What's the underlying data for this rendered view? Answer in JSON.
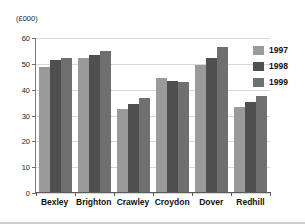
{
  "chart_data": {
    "type": "bar",
    "title": "",
    "xlabel": "",
    "ylabel": "(£000)",
    "ylim": [
      0,
      60
    ],
    "yticks": [
      0,
      10,
      20,
      30,
      40,
      50,
      60
    ],
    "grid": true,
    "legend_position": "right",
    "categories": [
      "Bexley",
      "Brighton",
      "Crawley",
      "Croydon",
      "Dover",
      "Redhill"
    ],
    "series": [
      {
        "name": "1997",
        "color": "#9a9a9a",
        "values": [
          48.5,
          52,
          32,
          44,
          49,
          33
        ]
      },
      {
        "name": "1998",
        "color": "#4f4f4f",
        "values": [
          51,
          53,
          34,
          43,
          52,
          35
        ]
      },
      {
        "name": "1999",
        "color": "#6f6f6f",
        "values": [
          52,
          54.5,
          36.5,
          42.5,
          56,
          37
        ]
      }
    ]
  },
  "axis": {
    "unit_label": "(£000)",
    "ytick_labels": [
      "60",
      "50",
      "40",
      "30",
      "20",
      "10",
      "0"
    ]
  },
  "header": {
    "cropped_title": ""
  },
  "legend": {
    "items": [
      {
        "label": "1997"
      },
      {
        "label": "1998"
      },
      {
        "label": "1999"
      }
    ]
  }
}
